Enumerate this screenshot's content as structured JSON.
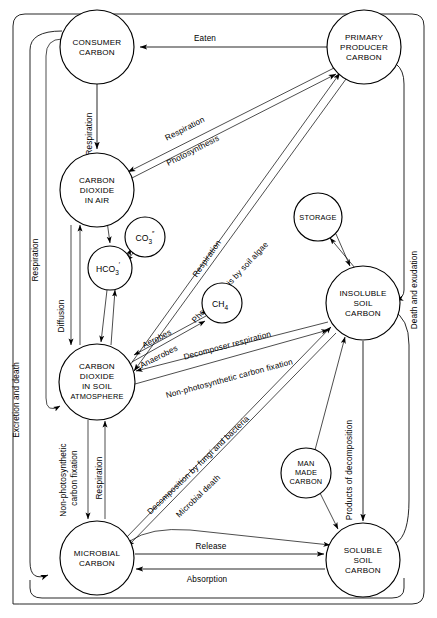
{
  "diagram": {
    "type": "flow-diagram",
    "background_color": "#ffffff",
    "line_color": "#000000",
    "width": 437,
    "height": 618
  },
  "nodes": [
    {
      "id": "consumer-carbon",
      "label_lines": [
        "CONSUMER",
        "CARBON"
      ],
      "cx": 97,
      "cy": 47,
      "r": 37
    },
    {
      "id": "primary-producer",
      "label_lines": [
        "PRIMARY",
        "PRODUCER",
        "CARBON"
      ],
      "cx": 364,
      "cy": 47,
      "r": 37
    },
    {
      "id": "co2-in-air",
      "label_lines": [
        "CARBON",
        "DIOXIDE",
        "IN AIR"
      ],
      "cx": 97,
      "cy": 190,
      "r": 37
    },
    {
      "id": "carbonate",
      "label_lines": [
        "CO3"
      ],
      "cx": 145,
      "cy": 237,
      "r": 20
    },
    {
      "id": "bicarbonate",
      "label_lines": [
        "HCO3"
      ],
      "cx": 110,
      "cy": 268,
      "r": 22
    },
    {
      "id": "storage",
      "label_lines": [
        "STORAGE"
      ],
      "cx": 318,
      "cy": 217,
      "r": 24
    },
    {
      "id": "methane",
      "label_lines": [
        "CH4"
      ],
      "cx": 222,
      "cy": 303,
      "r": 20
    },
    {
      "id": "insoluble-soil-carbon",
      "label_lines": [
        "INSOLUBLE",
        "SOIL",
        "CARBON"
      ],
      "cx": 363,
      "cy": 303,
      "r": 37
    },
    {
      "id": "co2-soil-atmosphere",
      "label_lines": [
        "CARBON",
        "DIOXIDE",
        "IN SOIL",
        "ATMOSPHERE"
      ],
      "cx": 97,
      "cy": 382,
      "r": 38
    },
    {
      "id": "man-made-carbon",
      "label_lines": [
        "MAN",
        "MADE",
        "CARBON"
      ],
      "cx": 306,
      "cy": 473,
      "r": 25
    },
    {
      "id": "microbial-carbon",
      "label_lines": [
        "MICROBIAL",
        "CARBON"
      ],
      "cx": 97,
      "cy": 558,
      "r": 37
    },
    {
      "id": "soluble-soil-carbon",
      "label_lines": [
        "SOLUBLE",
        "SOIL",
        "CARBON"
      ],
      "cx": 363,
      "cy": 560,
      "r": 37
    }
  ],
  "chem_labels": {
    "carbonate_main": "CO",
    "carbonate_sub": "3",
    "carbonate_sup": "″",
    "bicarbonate_main": "HCO",
    "bicarbonate_sub": "3",
    "bicarbonate_sup": "′",
    "methane_main": "CH",
    "methane_sub": "4"
  },
  "edge_labels": [
    {
      "id": "eaten",
      "text": "Eaten",
      "x": 205,
      "y": 41,
      "rotate": 0
    },
    {
      "id": "respiration-consumer-to-air",
      "text": "Respiration",
      "x": 92,
      "y": 134,
      "rotate": -90
    },
    {
      "id": "respiration-producer-to-air",
      "text": "Respiration",
      "x": 162,
      "y": 140,
      "rotate": -30
    },
    {
      "id": "photosynthesis-air-to-producer",
      "text": "Photosynthesis",
      "x": 163,
      "y": 162,
      "rotate": -30
    },
    {
      "id": "respiration-soil-to-producer",
      "text": "Respiration",
      "x": 207,
      "y": 262,
      "rotate": -56
    },
    {
      "id": "photosynthesis-by-soil-algae",
      "text": "Photosynthesis by soil algae",
      "x": 178,
      "y": 300,
      "rotate": -48
    },
    {
      "id": "excretion-and-death",
      "text": "Excretion and death",
      "x": 19,
      "y": 400,
      "rotate": -90
    },
    {
      "id": "respiration-left-column",
      "text": "Respiration",
      "x": 38,
      "y": 260,
      "rotate": -90
    },
    {
      "id": "diffusion",
      "text": "Diffusion",
      "x": 75,
      "y": 330,
      "rotate": -90
    },
    {
      "id": "death-and-exudation",
      "text": "Death and exudation",
      "x": 417,
      "y": 290,
      "rotate": -90
    },
    {
      "id": "aerobes",
      "text": "Aerobes",
      "x": 155,
      "y": 345,
      "rotate": -22
    },
    {
      "id": "anaerobes",
      "text": "Anaerobes",
      "x": 152,
      "y": 362,
      "rotate": -22
    },
    {
      "id": "decomposer-respiration",
      "text": "Decomposer respiration",
      "x": 198,
      "y": 358,
      "rotate": -16
    },
    {
      "id": "non-photosynthetic-carbon-fixation-upper",
      "text": "Non-photosynthetic carbon fixation",
      "x": 163,
      "y": 396,
      "rotate": -14
    },
    {
      "id": "decomposition-by-fungi-and-bacteria",
      "text": "Decomposition by fungi and bacteria",
      "x": 148,
      "y": 496,
      "rotate": -38
    },
    {
      "id": "microbial-death",
      "text": "Microbial death",
      "x": 178,
      "y": 510,
      "rotate": -38
    },
    {
      "id": "non-photosynthetic-carbon-fixation-left",
      "text": "Non-photosynthetic",
      "x": 66,
      "y": 482,
      "rotate": -90
    },
    {
      "id": "carbon-fixation-left-line2",
      "text": "carbon fixation",
      "x": 77,
      "y": 480,
      "rotate": -90
    },
    {
      "id": "respiration-microbial",
      "text": "Respiration",
      "x": 100,
      "y": 485,
      "rotate": -90
    },
    {
      "id": "products-of-decomposition",
      "text": "Products of decomposition",
      "x": 352,
      "y": 470,
      "rotate": -90
    },
    {
      "id": "release",
      "text": "Release",
      "x": 205,
      "y": 549,
      "rotate": 0
    },
    {
      "id": "absorption",
      "text": "Absorption",
      "x": 198,
      "y": 578,
      "rotate": 0
    }
  ],
  "frame": {
    "description": "Rounded outer border enclosing the diagram"
  }
}
